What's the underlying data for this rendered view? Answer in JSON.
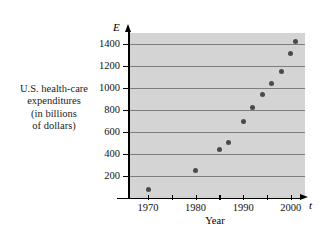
{
  "chart_data": {
    "type": "scatter",
    "title": "",
    "ylabel_lines": [
      "U.S. health-care",
      "expenditures",
      "(in billions",
      "of dollars)"
    ],
    "xlabel": "Year",
    "x_axis_symbol": "t",
    "y_axis_symbol": "E",
    "xlim": [
      1966,
      2003
    ],
    "ylim": [
      0,
      1500
    ],
    "x_ticks": [
      1970,
      1975,
      1980,
      1985,
      1990,
      1995,
      2000
    ],
    "x_tick_labels": [
      "1970",
      "",
      "1980",
      "",
      "1990",
      "",
      "2000"
    ],
    "y_ticks": [
      200,
      400,
      600,
      800,
      1000,
      1200,
      1400
    ],
    "y_tick_labels": [
      "200",
      "400",
      "600",
      "800",
      "1000",
      "1200",
      "1400"
    ],
    "grid": "horizontal",
    "legend": "none",
    "plot_background": "#d4d4d4",
    "marker_color": "#4a4a4a",
    "gridline_color": "#7d7d7d",
    "x": [
      1970,
      1980,
      1985,
      1987,
      1990,
      1992,
      1994,
      1996,
      1998,
      2000,
      2001
    ],
    "y": [
      75,
      250,
      440,
      505,
      700,
      820,
      940,
      1040,
      1150,
      1310,
      1425
    ],
    "points": [
      {
        "year": 1970,
        "value": 75
      },
      {
        "year": 1980,
        "value": 250
      },
      {
        "year": 1985,
        "value": 440
      },
      {
        "year": 1987,
        "value": 505
      },
      {
        "year": 1990,
        "value": 700
      },
      {
        "year": 1992,
        "value": 820
      },
      {
        "year": 1994,
        "value": 940
      },
      {
        "year": 1996,
        "value": 1040
      },
      {
        "year": 1998,
        "value": 1150
      },
      {
        "year": 2000,
        "value": 1310
      },
      {
        "year": 2001,
        "value": 1425
      }
    ]
  }
}
